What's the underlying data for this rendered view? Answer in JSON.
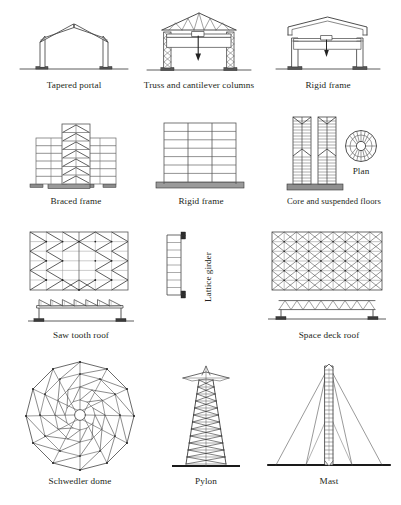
{
  "page": {
    "background_color": "#ffffff",
    "ink_color": "#231f20",
    "columns": 3,
    "rows": 4
  },
  "figures": [
    {
      "id": "tapered-portal",
      "caption": "Tapered portal",
      "row": 1,
      "col": 1,
      "type": "frame-elevation",
      "description": "Portal frame with tapered haunched columns and pitched rafters on ground line"
    },
    {
      "id": "truss-and-cantilever-columns",
      "caption": "Truss and cantilever columns",
      "row": 1,
      "col": 2,
      "type": "frame-elevation",
      "description": "Pitched roof truss on two lattice cantilever columns with crane hook load arrow"
    },
    {
      "id": "rigid-frame-portal",
      "caption": "Rigid frame",
      "row": 1,
      "col": 3,
      "type": "frame-elevation",
      "description": "Rigid portal frame with shallow pitched roof, crane beam and load arrow"
    },
    {
      "id": "braced-frame",
      "caption": "Braced frame",
      "row": 2,
      "col": 1,
      "type": "multistorey-elevation",
      "storeys": 7,
      "description": "Multi-storey frame with central braced core using chevron bracing"
    },
    {
      "id": "rigid-frame-multistorey",
      "caption": "Rigid frame",
      "row": 2,
      "col": 2,
      "type": "multistorey-elevation",
      "storeys": 7,
      "bays": 3,
      "description": "Multi-storey rigid frame with continuous beams and columns on raft"
    },
    {
      "id": "core-and-suspended-floors",
      "caption": "Core and suspended floors",
      "row": 2,
      "col": 3,
      "type": "tower-elevation",
      "description": "Twin towers of suspended floor slabs hung from central cores"
    },
    {
      "id": "plan",
      "caption": "Plan",
      "row": 2,
      "col": 3,
      "type": "plan-detail",
      "spokes": 16,
      "description": "Circular plan with radial floor beams around central core"
    },
    {
      "id": "saw-tooth-roof",
      "caption": "Saw tooth roof",
      "row": 3,
      "col": 1,
      "type": "roof-plan-and-elevation",
      "teeth": 7,
      "description": "Saw tooth roof plan with cross bracing and north-light elevation"
    },
    {
      "id": "lattice-girder",
      "caption": "Lattice girder",
      "row": 3,
      "col": 2,
      "type": "girder-detail",
      "orientation": "vertical",
      "description": "Lattice girder shown vertically with bearing plates at each end"
    },
    {
      "id": "space-deck-roof",
      "caption": "Space deck roof",
      "row": 3,
      "col": 3,
      "type": "roof-plan-and-elevation",
      "description": "Space deck grid plan with diagonal members and shallow truss elevation"
    },
    {
      "id": "schwedler-dome",
      "caption": "Schwedler dome",
      "row": 4,
      "col": 1,
      "type": "dome-plan",
      "rings": 4,
      "radials": 12,
      "description": "Schwedler dome plan showing meridional ribs, hoop rings and diagonal bracing"
    },
    {
      "id": "pylon",
      "caption": "Pylon",
      "row": 4,
      "col": 2,
      "type": "tower-elevation",
      "description": "Tapered lattice transmission pylon with cross arms and X bracing"
    },
    {
      "id": "mast",
      "caption": "Mast",
      "row": 4,
      "col": 3,
      "type": "mast-elevation",
      "guys": 4,
      "description": "Guyed lattice mast with stay cables to ground line"
    }
  ],
  "captions": {
    "tapered_portal": "Tapered portal",
    "truss_and_cantilever_columns": "Truss and cantilever columns",
    "rigid_frame_1": "Rigid frame",
    "braced_frame": "Braced frame",
    "rigid_frame_2": "Rigid frame",
    "core_and_suspended_floors": "Core and suspended floors",
    "plan": "Plan",
    "saw_tooth_roof": "Saw tooth roof",
    "lattice_girder": "Lattice girder",
    "space_deck_roof": "Space deck roof",
    "schwedler_dome": "Schwedler dome",
    "pylon": "Pylon",
    "mast": "Mast"
  }
}
